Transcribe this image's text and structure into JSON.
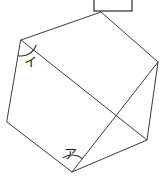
{
  "figure": {
    "shape_type": "hexagon",
    "stroke_color": "#3a3a3a",
    "background_color": "#ffffff",
    "vertices": [
      {
        "name": "top-left",
        "x": 21,
        "y": 40
      },
      {
        "name": "top",
        "x": 101,
        "y": 12
      },
      {
        "name": "right",
        "x": 158,
        "y": 62
      },
      {
        "name": "bottom-right",
        "x": 147,
        "y": 140
      },
      {
        "name": "bottom",
        "x": 72,
        "y": 172
      },
      {
        "name": "left",
        "x": 7,
        "y": 122
      }
    ],
    "diagonals": [
      {
        "name": "diagonal-topleft-bottomright",
        "x1": 21,
        "y1": 40,
        "x2": 147,
        "y2": 140
      },
      {
        "name": "diagonal-right-bottom",
        "x1": 158,
        "y1": 62,
        "x2": 72,
        "y2": 172
      }
    ],
    "angles": [
      {
        "id": "angle-a",
        "label": "ア",
        "vertex_x": 72,
        "vertex_y": 172,
        "label_x": 70,
        "label_y": 155,
        "arc_radius": 17,
        "arc_start_deg": 238,
        "arc_end_deg": 308
      },
      {
        "id": "angle-i",
        "label": "イ",
        "vertex_x": 21,
        "vertex_y": 40,
        "label_x": 29,
        "label_y": 61,
        "arc_radius": 16,
        "arc_start_deg": 19,
        "arc_end_deg": 99
      }
    ]
  },
  "answer_box": {
    "name": "answer-input-box",
    "value": "",
    "x": 94,
    "y": -8,
    "width": 38,
    "height": 20
  }
}
